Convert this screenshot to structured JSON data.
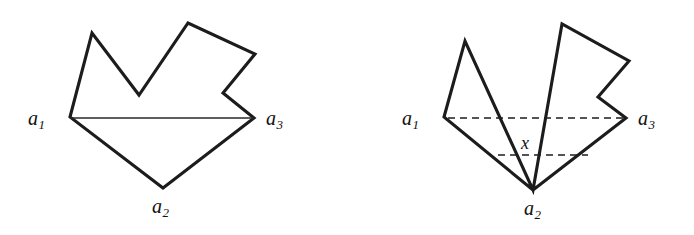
{
  "figure": {
    "background_color": "#ffffff",
    "stroke_color": "#1c1c1c",
    "chord_color": "#2a2a2a",
    "caption_hidden": "",
    "panels": [
      {
        "id": "left-panel",
        "name": "simple-polygon-panel",
        "description": "Simple polygon with a solid chord joining a1 and a3",
        "outline_points": "70,117 92,33 139,95 188,23 255,54 223,93 254,118 163,188",
        "chords": [
          {
            "id": "chord-a1-a3",
            "name": "chord-a1-a3-solid",
            "style": "solid",
            "x1": 71,
            "y1": 118,
            "x2": 253,
            "y2": 118
          }
        ],
        "labels": [
          {
            "id": "left-a1",
            "name": "vertex-label-a1",
            "text": "a",
            "sub": "1",
            "left": 28,
            "top": 108
          },
          {
            "id": "left-a2",
            "name": "vertex-label-a2",
            "text": "a",
            "sub": "2",
            "left": 152,
            "top": 196
          },
          {
            "id": "left-a3",
            "name": "vertex-label-a3",
            "text": "a",
            "sub": "3",
            "left": 266,
            "top": 108
          }
        ],
        "point_labels": []
      },
      {
        "id": "right-panel",
        "name": "self-intersecting-polygon-panel",
        "description": "Self-intersecting polygon with dashed chords and crossing point x",
        "outline_points": "444,117 465,41 533,190 562,24 629,61 598,97 626,118 533,190",
        "chords": [
          {
            "id": "chord-a1-a3-dashed",
            "name": "chord-a1-a3-dashed",
            "style": "dashed",
            "x1": 448,
            "y1": 118,
            "x2": 624,
            "y2": 118
          },
          {
            "id": "chord-lower-dashed",
            "name": "chord-lower-dashed",
            "style": "dashed",
            "x1": 498,
            "y1": 155,
            "x2": 588,
            "y2": 155
          }
        ],
        "labels": [
          {
            "id": "right-a1",
            "name": "vertex-label-a1",
            "text": "a",
            "sub": "1",
            "left": 402,
            "top": 108
          },
          {
            "id": "right-a2",
            "name": "vertex-label-a2",
            "text": "a",
            "sub": "2",
            "left": 524,
            "top": 198
          },
          {
            "id": "right-a3",
            "name": "vertex-label-a3",
            "text": "a",
            "sub": "3",
            "left": 638,
            "top": 108
          }
        ],
        "point_labels": [
          {
            "id": "crossing-x",
            "name": "crossing-point-label-x",
            "text": "x",
            "left": 521,
            "top": 134
          }
        ]
      }
    ]
  }
}
